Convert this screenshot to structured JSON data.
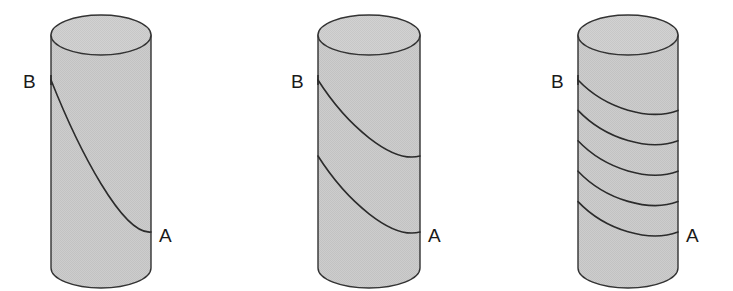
{
  "figure": {
    "background_color": "#ffffff",
    "width": 733,
    "height": 291,
    "body_fill_color": "#c9c9c9",
    "top_fill_color": "#cdcdcd",
    "stroke_color": "#333333",
    "label_color": "#1a1a1a"
  },
  "cylinders": [
    {
      "id": "cylinder-1",
      "name": "single-turn-helix",
      "helix_half_turns": 1,
      "geometry": {
        "left": 51,
        "right": 151,
        "top_center_y": 35,
        "bottom_center_y": 268,
        "ellipse_ry": 20
      },
      "start_label": {
        "text": "B",
        "x": 23,
        "y": 88
      },
      "end_label": {
        "text": "A",
        "x": 159,
        "y": 242
      },
      "path_start": {
        "x": 51,
        "y": 80
      },
      "path_end": {
        "x": 151,
        "y": 232
      }
    },
    {
      "id": "cylinder-2",
      "name": "two-turn-helix",
      "helix_half_turns": 2,
      "geometry": {
        "left": 318,
        "right": 420,
        "top_center_y": 35,
        "bottom_center_y": 268,
        "ellipse_ry": 20
      },
      "start_label": {
        "text": "B",
        "x": 291,
        "y": 88
      },
      "end_label": {
        "text": "A",
        "x": 428,
        "y": 242
      },
      "path_start": {
        "x": 318,
        "y": 80
      },
      "path_end": {
        "x": 420,
        "y": 232
      }
    },
    {
      "id": "cylinder-3",
      "name": "five-turn-helix",
      "helix_half_turns": 5,
      "geometry": {
        "left": 578,
        "right": 678,
        "top_center_y": 35,
        "bottom_center_y": 268,
        "ellipse_ry": 20
      },
      "start_label": {
        "text": "B",
        "x": 551,
        "y": 88
      },
      "end_label": {
        "text": "A",
        "x": 686,
        "y": 242
      },
      "path_start": {
        "x": 578,
        "y": 80
      },
      "path_end": {
        "x": 678,
        "y": 232
      }
    }
  ]
}
